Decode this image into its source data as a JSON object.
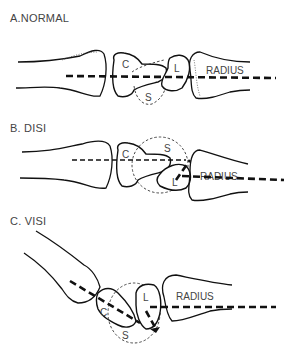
{
  "panels": [
    {
      "id": "normal",
      "title": "A.NORMAL",
      "labels": {
        "capitate": "C",
        "lunate": "L",
        "scaphoid": "S",
        "radius": "RADIUS"
      }
    },
    {
      "id": "disi",
      "title": "B. DISI",
      "labels": {
        "capitate": "C",
        "lunate": "L",
        "scaphoid": "S",
        "radius": "RADIUS"
      }
    },
    {
      "id": "visi",
      "title": "C. VISI",
      "labels": {
        "capitate": "C",
        "lunate": "L",
        "scaphoid": "S",
        "radius": "RADIUS"
      }
    }
  ]
}
